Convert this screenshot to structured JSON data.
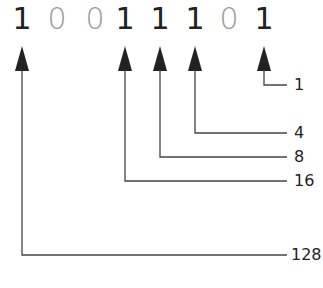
{
  "binary": {
    "digits": [
      "1",
      "0",
      "0",
      "1",
      "1",
      "1",
      "0",
      "1"
    ]
  },
  "labels": {
    "bit0": "1",
    "bit2": "4",
    "bit3": "8",
    "bit4": "16",
    "bit7": "128"
  },
  "colors": {
    "one": "#222222",
    "zero": "#9a9a9a",
    "line": "#444444"
  }
}
